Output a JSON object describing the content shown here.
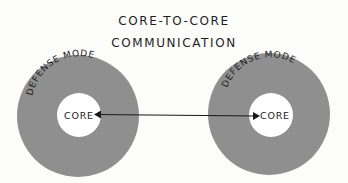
{
  "diagram": {
    "title_line1": "CORE-TO-CORE",
    "title_line2": "COMMUNICATION",
    "colors": {
      "ring": "#8f8f8f",
      "core": "#ffffff",
      "text": "#1e1e1e",
      "arrow": "#1a1a1a",
      "background": "#fcfcfb"
    },
    "nodes": [
      {
        "id": "left",
        "outer_label": "DEFENSE MODE",
        "inner_label": "CORE"
      },
      {
        "id": "right",
        "outer_label": "DEFENSE MODE",
        "inner_label": "CORE"
      }
    ],
    "edges": [
      {
        "from": "left",
        "to": "right",
        "type": "bidirectional-arrow"
      }
    ]
  }
}
